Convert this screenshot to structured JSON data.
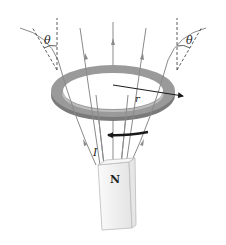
{
  "diagram": {
    "type": "physics-illustration",
    "labels": {
      "angle_left": "θ",
      "angle_right": "θ",
      "radius": "r",
      "current": "I",
      "pole": "N"
    },
    "elements": [
      {
        "name": "conducting-ring",
        "description": "Gray flat ring viewed in perspective"
      },
      {
        "name": "radius-arrow",
        "description": "Arrow from ring center to right edge labeled r"
      },
      {
        "name": "current-arrow",
        "description": "Curved black arrow below ring pointing left, labeled I"
      },
      {
        "name": "bar-magnet",
        "description": "Vertical white bar magnet with N pole at top"
      },
      {
        "name": "field-lines",
        "description": "Gray lines diverging upward from the N pole with arrowheads"
      },
      {
        "name": "angle-markers",
        "description": "Dashed vertical reference lines and tangent lines with angle θ at left and right edges"
      }
    ],
    "colors": {
      "ring_top": "#9a9a9a",
      "ring_side": "#7a7a7a",
      "field_line": "#8a8a8a",
      "arrow": "#1a1a1a",
      "magnet": "#f2f2f2"
    }
  }
}
